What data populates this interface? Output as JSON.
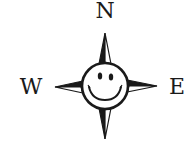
{
  "compass": {
    "labels": {
      "north": "N",
      "west": "W",
      "east": "E"
    },
    "center_icon": "smiley-face-icon",
    "colors": {
      "ink": "#1a1a1a",
      "background": "#ffffff"
    }
  }
}
